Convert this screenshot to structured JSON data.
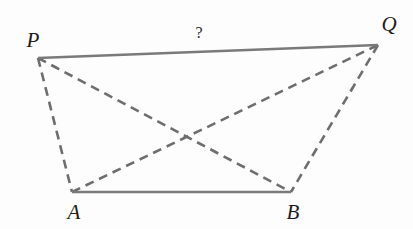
{
  "figure": {
    "kind": "geometry-diagram",
    "background_color": "#fdfdfd",
    "width": 413,
    "height": 229,
    "solid_stroke_color": "#7a7a7a",
    "dashed_stroke_color": "#6e6e6e",
    "solid_stroke_width": 2.4,
    "dashed_stroke_width": 2.6,
    "dash_pattern": "9 6"
  },
  "vertices": {
    "P": {
      "label": "P",
      "x": 38,
      "y": 58,
      "label_x": 33,
      "label_y": 40
    },
    "Q": {
      "label": "Q",
      "x": 378,
      "y": 45,
      "label_x": 389,
      "label_y": 24
    },
    "A": {
      "label": "A",
      "x": 72,
      "y": 192,
      "label_x": 74,
      "label_y": 212
    },
    "B": {
      "label": "B",
      "x": 291,
      "y": 192,
      "label_x": 293,
      "label_y": 212
    }
  },
  "segments": {
    "PQ": {
      "name": "PQ",
      "style": "solid",
      "from": "P",
      "to": "Q"
    },
    "AB": {
      "name": "AB",
      "style": "solid",
      "from": "A",
      "to": "B"
    },
    "PA": {
      "name": "PA",
      "style": "dashed",
      "from": "P",
      "to": "A"
    },
    "QB": {
      "name": "QB",
      "style": "dashed",
      "from": "Q",
      "to": "B"
    },
    "PB": {
      "name": "PB",
      "style": "dashed",
      "from": "P",
      "to": "B"
    },
    "AQ": {
      "name": "AQ",
      "style": "dashed",
      "from": "A",
      "to": "Q"
    }
  },
  "annotations": {
    "unknown_length": {
      "text": "?",
      "x": 199,
      "y": 33,
      "on_segment": "PQ"
    }
  }
}
